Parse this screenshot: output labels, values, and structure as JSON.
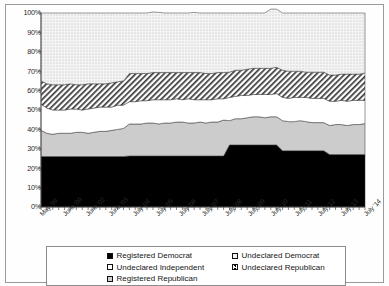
{
  "chart_data": {
    "type": "area",
    "stacked": true,
    "title": "",
    "xlabel": "",
    "ylabel": "",
    "ylim": [
      0,
      100
    ],
    "ytick_labels": [
      "100%",
      "90%",
      "80%",
      "70%",
      "60%",
      "50%",
      "40%",
      "30%",
      "20%",
      "10%",
      "0%"
    ],
    "ytick_values": [
      100,
      90,
      80,
      70,
      60,
      50,
      40,
      30,
      20,
      10,
      0
    ],
    "grid": false,
    "legend_position": "bottom",
    "xtick_labels": [
      "May '99",
      "June '00",
      "June '02",
      "June '03",
      "July '04",
      "July '05",
      "July '06",
      "July '07",
      "July '08",
      "July '09",
      "July '10",
      "July '11",
      "July '12",
      "July '13",
      "July '14"
    ],
    "x": [
      0,
      1,
      2,
      3,
      4,
      5,
      6,
      7,
      8,
      9,
      10,
      11,
      12,
      13,
      14,
      15,
      16,
      17,
      18,
      19,
      20,
      21,
      22,
      23,
      24,
      25,
      26,
      27,
      28,
      29,
      30,
      31,
      32,
      33,
      34,
      35,
      36,
      37,
      38,
      39,
      40,
      41,
      42,
      43,
      44,
      45,
      46,
      47,
      48,
      49,
      50,
      51,
      52,
      53,
      54,
      55
    ],
    "series": [
      {
        "name": "Registered Democrat",
        "fill": "black",
        "values": [
          26,
          26,
          26,
          26,
          26,
          26,
          26,
          26,
          26,
          26,
          26,
          26,
          26,
          26,
          26,
          26.3,
          26.3,
          26.3,
          26.3,
          26.3,
          26.3,
          26.3,
          26.3,
          26.3,
          26.3,
          26.3,
          26.3,
          26.3,
          26.3,
          26.3,
          26.3,
          26.3,
          32,
          32,
          32,
          32,
          32,
          32,
          32,
          32,
          32,
          29,
          29,
          29,
          29,
          29,
          29,
          29,
          29,
          27,
          27,
          27,
          27,
          27,
          27,
          27
        ]
      },
      {
        "name": "Registered Republican",
        "fill": "gray",
        "values": [
          13.5,
          12,
          11.5,
          12,
          12,
          12,
          12.5,
          12.5,
          12,
          12.5,
          13,
          13,
          13.5,
          14,
          14.5,
          16.5,
          16.5,
          16.5,
          17,
          17,
          16.5,
          17,
          17,
          17.5,
          17.5,
          17,
          17,
          17.5,
          17,
          17.5,
          17.5,
          18.5,
          12.5,
          13.5,
          13.5,
          14,
          14.5,
          14.5,
          14,
          14.5,
          14.5,
          15.5,
          15,
          15,
          15.5,
          15,
          14.5,
          14.5,
          14.5,
          15,
          15.5,
          15.5,
          15,
          15.5,
          15.5,
          16
        ]
      },
      {
        "name": "Undeclared Independent",
        "fill": "white",
        "values": [
          13.5,
          13,
          12.5,
          12,
          12,
          12.5,
          12,
          11.5,
          12.5,
          12.5,
          12.5,
          12.5,
          12,
          12.5,
          12,
          11.5,
          11.5,
          12,
          11.5,
          12,
          12.5,
          12,
          12,
          12,
          11.5,
          12.5,
          12,
          11.5,
          12,
          11.5,
          12,
          11,
          12,
          11.5,
          12,
          11.5,
          11.5,
          11.5,
          12,
          11.5,
          12,
          12,
          12,
          12.5,
          12,
          12.5,
          12.5,
          12.5,
          12.5,
          12.5,
          12,
          12.5,
          12.5,
          12.5,
          12.5,
          12
        ]
      },
      {
        "name": "Undeclared Republican",
        "fill": "hatch",
        "values": [
          12,
          12.5,
          13,
          13,
          13,
          13,
          12.5,
          13,
          13,
          12.5,
          12,
          12,
          12.5,
          12,
          12.5,
          14.5,
          14.5,
          14,
          14,
          14,
          14,
          14,
          14,
          13.5,
          14,
          13.5,
          14,
          14,
          13.5,
          13.5,
          13.5,
          13.5,
          13,
          13.5,
          13,
          13.5,
          13.5,
          13.5,
          13.5,
          13.5,
          13.5,
          14,
          14,
          13.5,
          13.5,
          13,
          13.5,
          13.5,
          13.5,
          13.5,
          13.5,
          13.5,
          14,
          13.5,
          13.5,
          14
        ]
      },
      {
        "name": "Undeclared Democrat",
        "fill": "dotted",
        "values": [
          35,
          36.5,
          37,
          37,
          37,
          36.5,
          37,
          37,
          36.5,
          36.5,
          36.5,
          36.5,
          36,
          35.5,
          35,
          31.2,
          31.2,
          31.2,
          31.2,
          31.2,
          31,
          30.7,
          30.7,
          30.7,
          30.7,
          30.7,
          31,
          30.7,
          31.2,
          31.2,
          30.7,
          30.7,
          30.5,
          29.5,
          29.5,
          29,
          28.5,
          28.5,
          28.5,
          30.5,
          30,
          29.5,
          30,
          30,
          30,
          30.5,
          30.5,
          30.5,
          30.5,
          32,
          32,
          31.5,
          31.5,
          31.5,
          31.5,
          31
        ]
      }
    ]
  },
  "legend": {
    "items": [
      {
        "label": "Registered Democrat",
        "swatch": "black",
        "col": 0,
        "row": 0
      },
      {
        "label": "Undeclared Democrat",
        "swatch": "dotted",
        "col": 1,
        "row": 0
      },
      {
        "label": "Undeclared Independent",
        "swatch": "white",
        "col": 0,
        "row": 1
      },
      {
        "label": "Undeclared Republican",
        "swatch": "hatch",
        "col": 1,
        "row": 1
      },
      {
        "label": "Registered Republican",
        "swatch": "gray",
        "col": 0,
        "row": 2
      }
    ]
  },
  "colors": {
    "registered_democrat": "#000000",
    "registered_republican": "#c9c9c9",
    "undeclared_independent": "#ffffff",
    "undeclared_republican": "#ffffff",
    "undeclared_democrat": "#efefef",
    "axis": "#555555",
    "frame": "#9a9a9a"
  }
}
